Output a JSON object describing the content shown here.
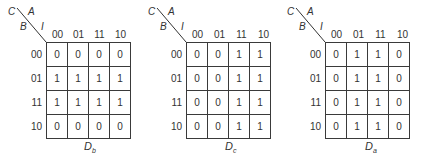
{
  "corner_labels": {
    "top_left": "C",
    "top_right": "A",
    "bottom_left": "B",
    "bottom_right": "I"
  },
  "column_headers": [
    "00",
    "01",
    "11",
    "10"
  ],
  "row_headers": [
    "00",
    "01",
    "11",
    "10"
  ],
  "maps": [
    {
      "title_main": "D",
      "title_sub": "b",
      "cells": [
        [
          "0",
          "0",
          "0",
          "0"
        ],
        [
          "1",
          "1",
          "1",
          "1"
        ],
        [
          "1",
          "1",
          "1",
          "1"
        ],
        [
          "0",
          "0",
          "0",
          "0"
        ]
      ]
    },
    {
      "title_main": "D",
      "title_sub": "c",
      "cells": [
        [
          "0",
          "0",
          "1",
          "1"
        ],
        [
          "0",
          "0",
          "1",
          "1"
        ],
        [
          "0",
          "0",
          "1",
          "1"
        ],
        [
          "0",
          "0",
          "1",
          "1"
        ]
      ]
    },
    {
      "title_main": "D",
      "title_sub": "a",
      "cells": [
        [
          "0",
          "1",
          "1",
          "0"
        ],
        [
          "0",
          "1",
          "1",
          "0"
        ],
        [
          "0",
          "1",
          "1",
          "0"
        ],
        [
          "0",
          "1",
          "1",
          "0"
        ]
      ]
    }
  ]
}
